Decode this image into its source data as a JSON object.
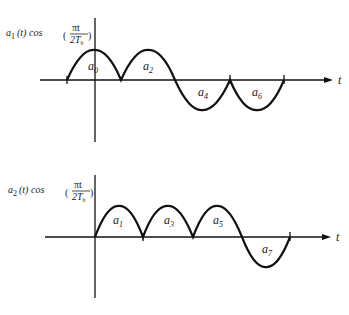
{
  "top_plot": {
    "ylabel": {
      "prefix": "a",
      "sub": "1",
      "func": "(t) cos",
      "num": "πt",
      "den": "2T",
      "den_sub": "b"
    },
    "xlabel": "t",
    "pulses": [
      {
        "label": "a",
        "sub": "0",
        "polarity": "positive"
      },
      {
        "label": "a",
        "sub": "2",
        "polarity": "positive"
      },
      {
        "label": "a",
        "sub": "4",
        "polarity": "negative"
      },
      {
        "label": "a",
        "sub": "6",
        "polarity": "negative"
      }
    ]
  },
  "bottom_plot": {
    "ylabel": {
      "prefix": "a",
      "sub": "2",
      "func": "(t) cos",
      "num": "πt",
      "den": "2T",
      "den_sub": "b"
    },
    "xlabel": "t",
    "pulses": [
      {
        "label": "a",
        "sub": "1",
        "polarity": "positive"
      },
      {
        "label": "a",
        "sub": "3",
        "polarity": "positive"
      },
      {
        "label": "a",
        "sub": "5",
        "polarity": "positive"
      },
      {
        "label": "a",
        "sub": "7",
        "polarity": "negative"
      }
    ]
  }
}
